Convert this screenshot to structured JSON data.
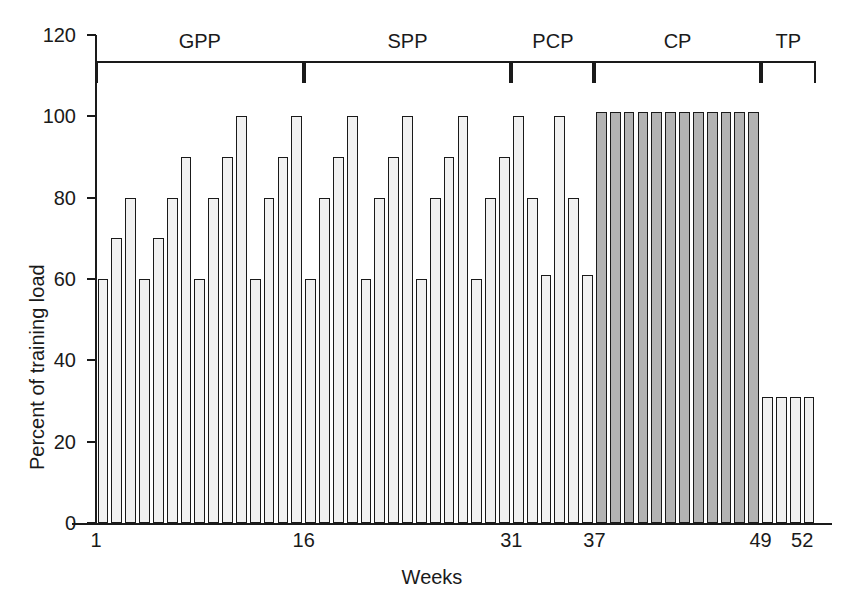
{
  "chart_data": {
    "type": "bar",
    "title": "",
    "xlabel": "Weeks",
    "ylabel": "Percent of training load",
    "ylim": [
      0,
      120
    ],
    "yticks": [
      0,
      20,
      40,
      60,
      80,
      100,
      120
    ],
    "ytick_labels": [
      "0",
      "20",
      "40",
      "60",
      "80",
      "100",
      "120"
    ],
    "xlim": [
      1,
      53
    ],
    "xticks": [
      1,
      16,
      31,
      37,
      49,
      52
    ],
    "xtick_labels": [
      "1",
      "16",
      "31",
      "37",
      "49",
      "52"
    ],
    "grid": false,
    "legend": "none",
    "categories": [
      1,
      2,
      3,
      4,
      5,
      6,
      7,
      8,
      9,
      10,
      11,
      12,
      13,
      14,
      15,
      16,
      17,
      18,
      19,
      20,
      21,
      22,
      23,
      24,
      25,
      26,
      27,
      28,
      29,
      30,
      31,
      32,
      33,
      34,
      35,
      36,
      37,
      38,
      39,
      40,
      41,
      42,
      43,
      44,
      45,
      46,
      47,
      48,
      49,
      50,
      51,
      52
    ],
    "values": [
      60,
      70,
      80,
      60,
      70,
      80,
      90,
      60,
      80,
      90,
      100,
      60,
      80,
      90,
      100,
      60,
      80,
      90,
      100,
      60,
      80,
      90,
      100,
      60,
      80,
      90,
      100,
      60,
      80,
      90,
      100,
      80,
      61,
      100,
      80,
      61,
      101,
      101,
      101,
      101,
      101,
      101,
      101,
      101,
      101,
      101,
      101,
      101,
      31,
      31,
      31,
      31
    ],
    "bar_fills": [
      "light",
      "light",
      "light",
      "light",
      "light",
      "light",
      "light",
      "light",
      "light",
      "light",
      "light",
      "light",
      "light",
      "light",
      "light",
      "light",
      "light",
      "light",
      "light",
      "light",
      "light",
      "light",
      "light",
      "light",
      "light",
      "light",
      "light",
      "light",
      "light",
      "light",
      "light",
      "light",
      "light",
      "light",
      "light",
      "light",
      "dark",
      "dark",
      "dark",
      "dark",
      "dark",
      "dark",
      "dark",
      "dark",
      "dark",
      "dark",
      "dark",
      "dark",
      "light",
      "light",
      "light",
      "light"
    ],
    "colors": {
      "light_bar": "#f1f1f1",
      "dark_bar": "#b3b3b3",
      "outline": "#1a1a1a",
      "axis": "#1a1a1a",
      "background": "#ffffff"
    },
    "annotations": [
      {
        "label": "GPP",
        "start_week": 1,
        "end_week": 16,
        "note": "General Preparation Phase"
      },
      {
        "label": "SPP",
        "start_week": 16,
        "end_week": 31,
        "note": "Specific Preparation Phase"
      },
      {
        "label": "PCP",
        "start_week": 31,
        "end_week": 37,
        "note": "Pre-Competition Phase"
      },
      {
        "label": "CP",
        "start_week": 37,
        "end_week": 49,
        "note": "Competition Phase"
      },
      {
        "label": "TP",
        "start_week": 49,
        "end_week": 53,
        "note": "Transition Phase"
      }
    ]
  }
}
